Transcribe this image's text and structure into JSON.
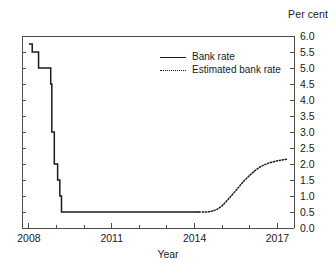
{
  "chart_data": {
    "type": "line",
    "title": "",
    "unit_label": "Per cent",
    "xlabel": "Year",
    "ylabel": "",
    "xlim": [
      2007.75,
      2017.6
    ],
    "ylim": [
      0.0,
      6.0
    ],
    "grid": false,
    "legend_position": "inside-top-center",
    "xticks": [
      2008,
      2011,
      2014,
      2017
    ],
    "xticklabels": [
      "2008",
      "2011",
      "2014",
      "2017"
    ],
    "xminorticks": [
      2009,
      2010,
      2012,
      2013,
      2015,
      2016
    ],
    "yticks": [
      0.0,
      0.5,
      1.0,
      1.5,
      2.0,
      2.5,
      3.0,
      3.5,
      4.0,
      4.5,
      5.0,
      5.5,
      6.0
    ],
    "yticklabels": [
      "0.0",
      "0.5",
      "1.0",
      "1.5",
      "2.0",
      "2.5",
      "3.0",
      "3.5",
      "4.0",
      "4.5",
      "5.0",
      "5.5",
      "6.0"
    ],
    "series": [
      {
        "name": "Bank rate",
        "style": "solid",
        "color": "#1a1a1a",
        "interpolation": "step-post",
        "x": [
          2008.0,
          2008.09,
          2008.12,
          2008.33,
          2008.35,
          2008.75,
          2008.79,
          2008.83,
          2008.87,
          2008.92,
          2008.96,
          2009.04,
          2009.12,
          2009.18,
          2014.17
        ],
        "y": [
          5.75,
          5.75,
          5.5,
          5.5,
          5.0,
          5.0,
          4.5,
          3.0,
          3.0,
          2.0,
          2.0,
          1.5,
          1.0,
          0.5,
          0.5
        ]
      },
      {
        "name": "Estimated bank rate",
        "style": "dotted",
        "color": "#1a1a1a",
        "interpolation": "smooth",
        "x": [
          2014.17,
          2014.4,
          2014.6,
          2014.8,
          2015.0,
          2015.2,
          2015.4,
          2015.6,
          2015.8,
          2016.0,
          2016.2,
          2016.4,
          2016.6,
          2016.8,
          2017.0,
          2017.2,
          2017.35
        ],
        "y": [
          0.5,
          0.5,
          0.52,
          0.58,
          0.7,
          0.88,
          1.08,
          1.28,
          1.48,
          1.65,
          1.8,
          1.92,
          2.0,
          2.06,
          2.1,
          2.13,
          2.15
        ]
      }
    ]
  },
  "legend": {
    "items": [
      {
        "label": "Bank rate",
        "style": "solid"
      },
      {
        "label": "Estimated bank rate",
        "style": "dotted"
      }
    ]
  },
  "colors": {
    "line": "#1a1a1a",
    "axis": "#4d4d4d",
    "background": "#ffffff"
  }
}
